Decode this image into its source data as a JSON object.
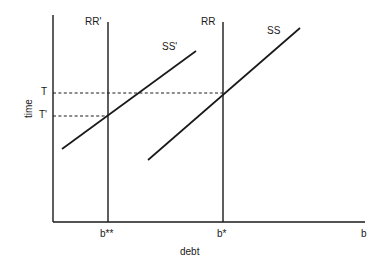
{
  "figure": {
    "kind": "economics-line-diagram",
    "background_color": "#ffffff",
    "line_color": "#1a1a1a",
    "axes": {
      "x_axis_label": "debt",
      "y_axis_label": "time",
      "x_axis_arrow_label": "b",
      "x_origin_px": 53,
      "x_end_px": 365,
      "y_top_px": 15,
      "y_baseline_px": 222
    },
    "tick_labels": {
      "y": [
        {
          "name": "T",
          "text": "T",
          "y_px": 93
        },
        {
          "name": "T-prime",
          "text": "T'",
          "y_px": 116
        }
      ],
      "x": [
        {
          "name": "b-double-star",
          "text": "b**",
          "x_px": 108
        },
        {
          "name": "b-star",
          "text": "b*",
          "x_px": 223
        }
      ]
    },
    "vertical_lines": [
      {
        "name": "RR-prime",
        "label": "RR'",
        "x_px": 108,
        "y_top_px": 22,
        "y_bottom_px": 222
      },
      {
        "name": "RR",
        "label": "RR",
        "x_px": 223,
        "y_top_px": 22,
        "y_bottom_px": 222
      }
    ],
    "upward_lines": [
      {
        "name": "SS-prime",
        "label": "SS'",
        "x1_px": 62,
        "y1_px": 149,
        "x2_px": 196,
        "y2_px": 51
      },
      {
        "name": "SS",
        "label": "SS",
        "x1_px": 148,
        "y1_px": 160,
        "x2_px": 300,
        "y2_px": 28
      }
    ],
    "dashed_lines": [
      {
        "name": "T-guide",
        "from_x_px": 53,
        "to_x_px": 223,
        "y_px": 93
      },
      {
        "name": "T-prime-guide",
        "from_x_px": 53,
        "to_x_px": 108,
        "y_px": 116
      }
    ],
    "intersections": [
      {
        "name": "equilibrium-original",
        "x_label": "b*",
        "y_label": "T"
      },
      {
        "name": "equilibrium-shifted",
        "x_label": "b**",
        "y_label": "T'"
      }
    ]
  },
  "chart_data": {
    "type": "line",
    "title": "",
    "xlabel": "debt",
    "ylabel": "time",
    "grid": false,
    "legend": "none",
    "annotations": [
      "RR'",
      "RR",
      "SS'",
      "SS",
      "T",
      "T'",
      "b**",
      "b*",
      "b"
    ],
    "series": [
      {
        "name": "RR'",
        "kind": "vertical",
        "x": "b**"
      },
      {
        "name": "RR",
        "kind": "vertical",
        "x": "b*"
      },
      {
        "name": "SS'",
        "kind": "upward-sloping"
      },
      {
        "name": "SS",
        "kind": "upward-sloping"
      }
    ]
  }
}
